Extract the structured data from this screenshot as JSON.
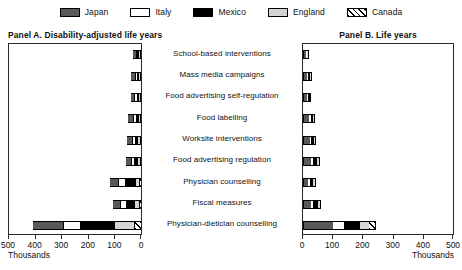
{
  "legend": {
    "items": [
      {
        "label": "Japan",
        "key": "japan",
        "color": "#595959",
        "pattern": "solid"
      },
      {
        "label": "Italy",
        "key": "italy",
        "color": "#ffffff",
        "pattern": "solid"
      },
      {
        "label": "Mexico",
        "key": "mexico",
        "color": "#000000",
        "pattern": "solid"
      },
      {
        "label": "England",
        "key": "england",
        "color": "#d4d4d4",
        "pattern": "solid"
      },
      {
        "label": "Canada",
        "key": "canada",
        "color": "#000000",
        "pattern": "diagonal-hatch"
      }
    ]
  },
  "panelA": {
    "title": "Panel A. Disability-adjusted life years"
  },
  "panelB": {
    "title": "Panel B. Life years"
  },
  "categories": [
    "School-based interventions",
    "Mass media campaigns",
    "Food advertising self-regulation",
    "Food labelling",
    "Worksite interventions",
    "Food advertising regulation",
    "Physician counselling",
    "Fiscal measures",
    "Physician-dietician counselling"
  ],
  "axisA": {
    "unit": "Thousands",
    "ticks": [
      500,
      400,
      300,
      200,
      100,
      0
    ],
    "tick_labels": [
      "500",
      "400",
      "300",
      "200",
      "100",
      "0"
    ],
    "min": 0,
    "max": 500,
    "direction": "reversed"
  },
  "axisB": {
    "unit": "Thousands",
    "ticks": [
      0,
      100,
      200,
      300,
      400,
      500
    ],
    "tick_labels": [
      "0",
      "100",
      "200",
      "300",
      "400",
      "500"
    ],
    "min": 0,
    "max": 500,
    "direction": "normal"
  },
  "chart_data": {
    "type": "bar",
    "subtype": "stacked-horizontal-paired-panels",
    "grid": false,
    "legend_position": "top-center",
    "series_order_panelA": [
      "canada",
      "england",
      "mexico",
      "italy",
      "japan"
    ],
    "series_order_panelB": [
      "japan",
      "italy",
      "mexico",
      "england",
      "canada"
    ],
    "categories": [
      "School-based interventions",
      "Mass media campaigns",
      "Food advertising self-regulation",
      "Food labelling",
      "Worksite interventions",
      "Food advertising regulation",
      "Physician counselling",
      "Fiscal measures",
      "Physician-dietician counselling"
    ],
    "panels": [
      {
        "name": "Panel A. Disability-adjusted life years",
        "xlabel": "Thousands",
        "ylabel": "",
        "xlim": [
          0,
          500
        ],
        "x_reversed": true,
        "series": [
          {
            "name": "Japan",
            "key": "japan",
            "values": [
              14,
              18,
              16,
              22,
              24,
              26,
              34,
              32,
              120
            ]
          },
          {
            "name": "Italy",
            "key": "italy",
            "values": [
              3,
              4,
              5,
              6,
              7,
              8,
              22,
              18,
              60
            ]
          },
          {
            "name": "Mexico",
            "key": "mexico",
            "values": [
              8,
              10,
              9,
              12,
              13,
              14,
              44,
              36,
              130
            ]
          },
          {
            "name": "England",
            "key": "england",
            "values": [
              2,
              3,
              4,
              5,
              6,
              7,
              12,
              14,
              75
            ]
          },
          {
            "name": "Canada",
            "key": "canada",
            "values": [
              1,
              1,
              2,
              2,
              3,
              3,
              6,
              7,
              25
            ]
          }
        ],
        "totals": [
          28,
          36,
          36,
          47,
          53,
          58,
          118,
          107,
          410
        ]
      },
      {
        "name": "Panel B. Life years",
        "xlabel": "Thousands",
        "ylabel": "",
        "xlim": [
          0,
          500
        ],
        "x_reversed": false,
        "series": [
          {
            "name": "Japan",
            "key": "japan",
            "values": [
              10,
              14,
              14,
              20,
              22,
              26,
              18,
              26,
              100
            ]
          },
          {
            "name": "Italy",
            "key": "italy",
            "values": [
              2,
              4,
              4,
              5,
              6,
              8,
              6,
              9,
              38
            ]
          },
          {
            "name": "Mexico",
            "key": "mexico",
            "values": [
              2,
              6,
              5,
              8,
              9,
              12,
              10,
              14,
              52
            ]
          },
          {
            "name": "England",
            "key": "england",
            "values": [
              1,
              2,
              2,
              4,
              4,
              6,
              5,
              7,
              30
            ]
          },
          {
            "name": "Canada",
            "key": "canada",
            "values": [
              1,
              1,
              1,
              2,
              2,
              3,
              3,
              4,
              22
            ]
          }
        ],
        "totals": [
          16,
          27,
          26,
          39,
          43,
          55,
          42,
          60,
          242
        ]
      }
    ]
  }
}
